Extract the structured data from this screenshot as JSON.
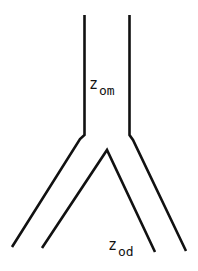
{
  "diagram": {
    "type": "bifurcating-vessel",
    "stroke_color": "#111111",
    "labels": {
      "parent": {
        "main": "z",
        "sub": "om"
      },
      "daughter": {
        "main": "z",
        "sub": "od"
      }
    }
  }
}
